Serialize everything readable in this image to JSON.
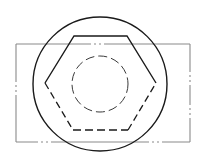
{
  "drawing": {
    "type": "technical-drawing",
    "view": "top view of hexagon nut over rectangular plate",
    "colors": {
      "background": "#ffffff",
      "outline": "#1a1a1a",
      "centerline": "#8a8a8a",
      "hidden": "#3a3a3a"
    },
    "rectangle": {
      "x": 16,
      "y": 44,
      "width": 174,
      "height": 98,
      "line_style": "dash-dot"
    },
    "outer_circle": {
      "cx": 100,
      "cy": 84,
      "r": 67,
      "line_style": "solid"
    },
    "hexagon": {
      "vertices": [
        [
          74,
          36
        ],
        [
          127,
          36
        ],
        [
          156,
          83
        ],
        [
          128,
          130
        ],
        [
          73,
          130
        ],
        [
          45,
          83
        ]
      ],
      "solid_edges": "top, upper-left, upper-right",
      "hidden_edges": "lower-left, bottom, lower-right"
    },
    "inner_circle": {
      "cx": 100,
      "cy": 84,
      "r": 28,
      "line_style": "dashed"
    }
  }
}
